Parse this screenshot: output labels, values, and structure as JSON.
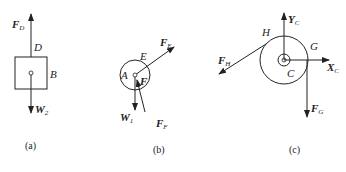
{
  "figures": [
    {
      "id": "a",
      "caption": "(a)",
      "labels": {
        "force_up": {
          "main": "F",
          "sub": "D"
        },
        "point_D": "D",
        "body_B": "B",
        "weight": {
          "main": "W",
          "sub": "2"
        }
      }
    },
    {
      "id": "b",
      "caption": "(b)",
      "labels": {
        "force_E": {
          "main": "F",
          "sub": "E"
        },
        "point_E": "E",
        "point_A": "A",
        "point_F": "F",
        "weight": {
          "main": "W",
          "sub": "1"
        },
        "force_F": {
          "main": "F",
          "sub": "F"
        }
      }
    },
    {
      "id": "c",
      "caption": "(c)",
      "labels": {
        "force_Y": {
          "main": "Y",
          "sub": "C"
        },
        "point_H": "H",
        "point_G": "G",
        "force_H": {
          "main": "F",
          "sub": "H"
        },
        "force_X": {
          "main": "X",
          "sub": "C"
        },
        "point_C": "C",
        "force_G": {
          "main": "F",
          "sub": "G"
        }
      }
    }
  ]
}
